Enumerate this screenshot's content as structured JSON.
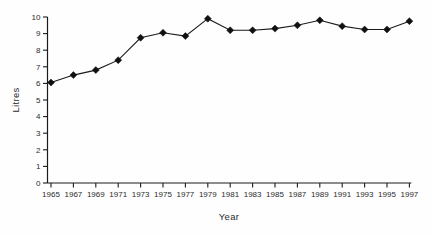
{
  "chart_data": {
    "type": "line",
    "title": "",
    "xlabel": "Year",
    "ylabel": "Litres",
    "x": [
      1965,
      1967,
      1969,
      1971,
      1973,
      1975,
      1977,
      1979,
      1981,
      1983,
      1985,
      1987,
      1989,
      1991,
      1993,
      1995,
      1997
    ],
    "values": [
      6.05,
      6.5,
      6.8,
      7.4,
      8.75,
      9.05,
      8.85,
      9.9,
      9.2,
      9.2,
      9.3,
      9.5,
      9.8,
      9.45,
      9.25,
      9.25,
      9.75
    ],
    "ylim": [
      0,
      10
    ],
    "yticks": [
      0,
      1,
      2,
      3,
      4,
      5,
      6,
      7,
      8,
      9,
      10
    ],
    "marker": "diamond",
    "line_color": "#1b1b1b",
    "marker_color": "#111111",
    "text_color": "#2b2b2b",
    "grid": false,
    "legend": "none"
  }
}
